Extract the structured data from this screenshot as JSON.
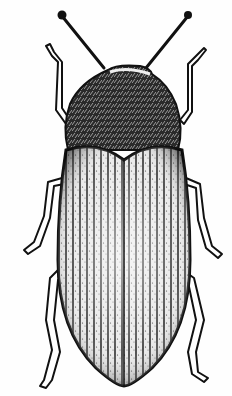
{
  "image": {
    "subject": "beetle illustration",
    "style": "black-and-white engraving, dorsal view",
    "alt": "Dorsal view engraving of a beetle with striated elytra, hairy pronotum, long antennae and six legs",
    "colors": {
      "background": "#fefefe",
      "ink": "#111111",
      "highlight": "#f2f2f2"
    }
  }
}
